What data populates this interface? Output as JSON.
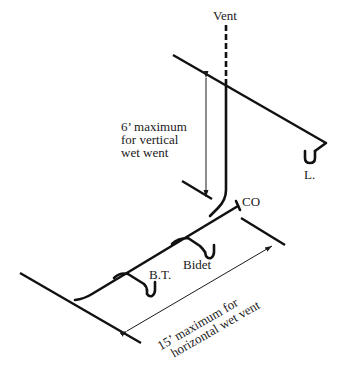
{
  "diagram": {
    "labels": {
      "vent": "Vent",
      "lavatory": "L.",
      "cleanout": "CO",
      "bidet": "Bidet",
      "bathtub": "B.T."
    },
    "vertical_dimension": {
      "lines": [
        "6’ maximum",
        "for vertical",
        "wet went"
      ]
    },
    "horizontal_dimension": {
      "lines": [
        "15’ maximum for",
        "horizontal wet vent"
      ]
    },
    "colors": {
      "line": "#111111",
      "background": "#ffffff"
    }
  }
}
